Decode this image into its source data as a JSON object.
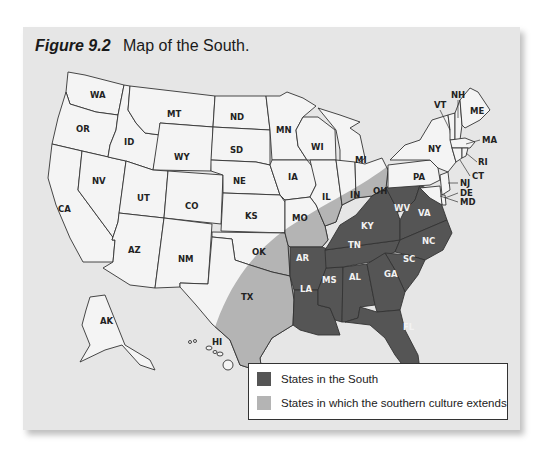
{
  "figure": {
    "label": "Figure 9.2",
    "caption": "Map of the South."
  },
  "colors": {
    "south": "#555555",
    "culture": "#b4b4b4",
    "other": "#f4f4f4",
    "background": "#e6e6e6",
    "border": "#333333"
  },
  "states": {
    "south": [
      "AR",
      "LA",
      "MS",
      "AL",
      "TN",
      "KY",
      "WV",
      "VA",
      "NC",
      "SC",
      "GA",
      "FL"
    ],
    "culture_extends": [
      "TX",
      "OK",
      "MO",
      "IL",
      "IN",
      "OH"
    ],
    "other": [
      "WA",
      "OR",
      "CA",
      "NV",
      "ID",
      "MT",
      "WY",
      "UT",
      "CO",
      "AZ",
      "NM",
      "ND",
      "SD",
      "NE",
      "KS",
      "MN",
      "IA",
      "WI",
      "MI",
      "NY",
      "PA",
      "VT",
      "NH",
      "ME",
      "MA",
      "RI",
      "CT",
      "NJ",
      "DE",
      "MD",
      "AK",
      "HI"
    ]
  },
  "labels": {
    "WA": "WA",
    "OR": "OR",
    "CA": "CA",
    "NV": "NV",
    "ID": "ID",
    "MT": "MT",
    "WY": "WY",
    "UT": "UT",
    "CO": "CO",
    "AZ": "AZ",
    "NM": "NM",
    "ND": "ND",
    "SD": "SD",
    "NE": "NE",
    "KS": "KS",
    "OK": "OK",
    "TX": "TX",
    "MN": "MN",
    "IA": "IA",
    "MO": "MO",
    "AR": "AR",
    "LA": "LA",
    "WI": "WI",
    "IL": "IL",
    "MS": "MS",
    "MI": "MI",
    "IN": "IN",
    "KY": "KY",
    "TN": "TN",
    "AL": "AL",
    "OH": "OH",
    "WV": "WV",
    "VA": "VA",
    "NC": "NC",
    "SC": "SC",
    "GA": "GA",
    "FL": "FL",
    "PA": "PA",
    "NY": "NY",
    "VT": "VT",
    "NH": "NH",
    "ME": "ME",
    "MA": "MA",
    "RI": "RI",
    "CT": "CT",
    "NJ": "NJ",
    "DE": "DE",
    "MD": "MD",
    "AK": "AK",
    "HI": "HI"
  },
  "legend": {
    "items": [
      {
        "label": "States in the South",
        "color": "#555555"
      },
      {
        "label": "States in which the southern culture extends",
        "color": "#b4b4b4"
      }
    ]
  }
}
